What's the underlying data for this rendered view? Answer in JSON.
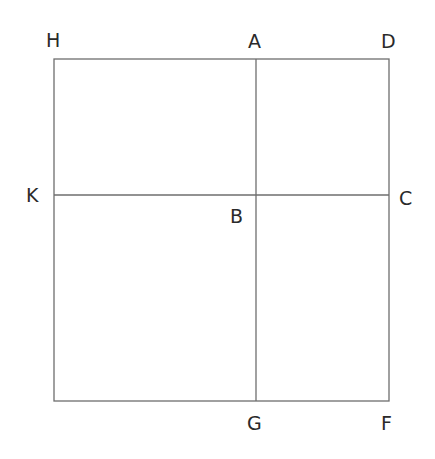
{
  "diagram": {
    "type": "geometry-figure",
    "points": {
      "H": {
        "label": "H",
        "x": 54,
        "y": 59
      },
      "A": {
        "label": "A",
        "x": 256,
        "y": 59
      },
      "D": {
        "label": "D",
        "x": 389,
        "y": 59
      },
      "K": {
        "label": "K",
        "x": 54,
        "y": 195
      },
      "B": {
        "label": "B",
        "x": 256,
        "y": 195
      },
      "C": {
        "label": "C",
        "x": 389,
        "y": 195
      },
      "G": {
        "label": "G",
        "x": 256,
        "y": 401
      },
      "F": {
        "label": "F",
        "x": 389,
        "y": 401
      }
    },
    "segments": [
      {
        "name": "HD",
        "from": "H",
        "to": "D"
      },
      {
        "name": "DF",
        "from": "D",
        "to": "F"
      },
      {
        "name": "F-bottom-left",
        "from": "F",
        "to": "bottom-left-corner"
      },
      {
        "name": "left-side",
        "from": "bottom-left-corner",
        "to": "H"
      },
      {
        "name": "AG",
        "from": "A",
        "to": "G"
      },
      {
        "name": "KC",
        "from": "K",
        "to": "C"
      }
    ],
    "labels": {
      "H": "H",
      "A": "A",
      "D": "D",
      "K": "K",
      "B": "B",
      "C": "C",
      "G": "G",
      "F": "F"
    },
    "colors": {
      "line": "#6e6e6e",
      "text": "#2a2a2a",
      "background": "#ffffff"
    }
  }
}
